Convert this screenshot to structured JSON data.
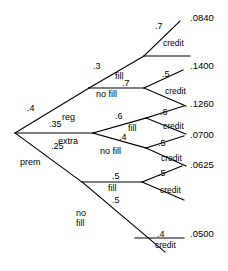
{
  "diagram": {
    "type": "probability-tree",
    "root": {
      "label": ""
    },
    "level1": [
      {
        "id": "reg",
        "probability": ".4",
        "label": "reg"
      },
      {
        "id": "extra",
        "probability": ".35",
        "label": "extra"
      },
      {
        "id": "prem",
        "probability": ".25",
        "label": "prem"
      }
    ],
    "level2": [
      {
        "id": "reg-fill",
        "parent": "reg",
        "probability": ".3",
        "label": "fill"
      },
      {
        "id": "reg-nofill",
        "parent": "reg",
        "probability": ".7",
        "label": "no fill"
      },
      {
        "id": "extra-fill",
        "parent": "extra",
        "probability": ".6",
        "label": "fill"
      },
      {
        "id": "extra-nofill",
        "parent": "extra",
        "probability": ".4",
        "label": "no fill"
      },
      {
        "id": "prem-fill",
        "parent": "prem",
        "probability": ".5",
        "label": "fill"
      },
      {
        "id": "prem-nofill",
        "parent": "prem",
        "probability": ".5",
        "label": "no\nfill"
      }
    ],
    "level2_nofill_lower": {
      "line1": "no",
      "line2": "fill"
    },
    "level3": [
      {
        "id": "credit-1",
        "parent": "reg-fill",
        "probability": ".7",
        "label": "credit",
        "outcome": ".0840"
      },
      {
        "id": "credit-2",
        "parent": "reg-nofill",
        "probability": ".5",
        "label": "credit",
        "outcome": ".1400"
      },
      {
        "id": "credit-3",
        "parent": "extra-fill",
        "probability": ".6",
        "label": "credit",
        "outcome": ".1260"
      },
      {
        "id": "credit-4",
        "parent": "extra-nofill",
        "probability": ".5",
        "label": "credit",
        "outcome": ".0700"
      },
      {
        "id": "credit-5",
        "parent": "prem-fill",
        "probability": ".5",
        "label": "credit",
        "outcome": ".0625"
      },
      {
        "id": "credit-6",
        "parent": "prem-nofill",
        "probability": ".4",
        "label": "credit",
        "outcome": ".0500"
      }
    ],
    "colors": {
      "line": "#000000",
      "text": "#000000",
      "background": "#ffffff"
    }
  }
}
